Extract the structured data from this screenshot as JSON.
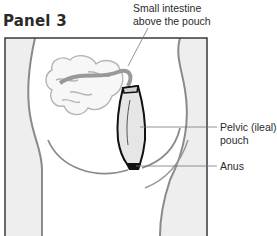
{
  "panel": {
    "title": "Panel 3"
  },
  "labels": {
    "small_intestine_line1": "Small intestine",
    "small_intestine_line2": "above the pouch",
    "pouch_line1": "Pelvic (ileal)",
    "pouch_line2": "pouch",
    "anus": "Anus"
  },
  "colors": {
    "frame": "#3a3a3a",
    "body_shading": "#ececec",
    "body_outline": "#8a8a8a",
    "intestine_outline": "#b5b5b5",
    "pouch_outline": "#111111",
    "leader_line": "#777777",
    "text": "#2b2b2b"
  }
}
